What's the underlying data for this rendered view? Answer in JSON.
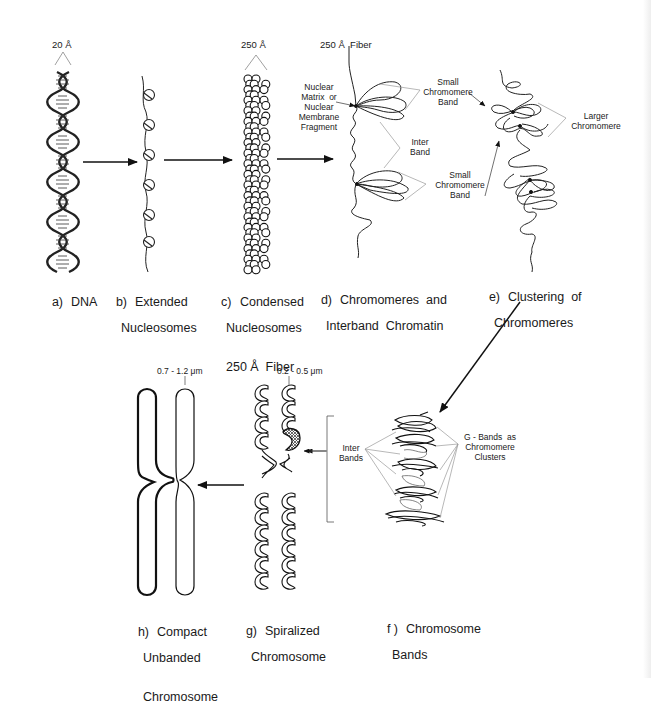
{
  "figure": {
    "stages": [
      {
        "id": "a",
        "tag": "a)",
        "lines": [
          "DNA"
        ]
      },
      {
        "id": "b",
        "tag": "b)",
        "lines": [
          "Extended",
          "Nucleosomes"
        ]
      },
      {
        "id": "c",
        "tag": "c)",
        "lines": [
          "Condensed",
          "Nucleosomes",
          "250 Å  Fiber"
        ]
      },
      {
        "id": "d",
        "tag": "d)",
        "lines": [
          "Chromomeres  and",
          "Interband  Chromatin"
        ]
      },
      {
        "id": "e",
        "tag": "e)",
        "lines": [
          "Clustering  of",
          "Chromomeres"
        ]
      },
      {
        "id": "f",
        "tag": "f )",
        "lines": [
          "Chromosome",
          "Bands"
        ]
      },
      {
        "id": "g",
        "tag": "g)",
        "lines": [
          "Spiralized",
          "Chromosome"
        ]
      },
      {
        "id": "h",
        "tag": "h)",
        "lines": [
          "Compact",
          "Unbanded",
          "Chromosome"
        ]
      }
    ],
    "dimensions": {
      "dna_width": "20 Å",
      "fiber_width": "250 Å",
      "fiber_label": "250 Å  Fiber",
      "spiral_width": "0.2 - 0.5 μm",
      "compact_width": "0.7 - 1.2 μm"
    },
    "annotations": {
      "nuclear_matrix": "Nuclear\nMatrix  or\nNuclear\nMembrane\nFragment",
      "small_band_top": "Small\nChromomere\nBand",
      "inter_band": "Inter\nBand",
      "small_band_bottom": "Small\nChromomere\nBand",
      "larger_chromomere": "Larger\nChromomere",
      "inter_bands": "Inter\nBands",
      "g_bands": "G - Bands  as\nChromomere\nClusters"
    },
    "colors": {
      "ink": "#1a1a1a",
      "background": "#ffffff",
      "edge_shade": "#eeeeee"
    }
  }
}
